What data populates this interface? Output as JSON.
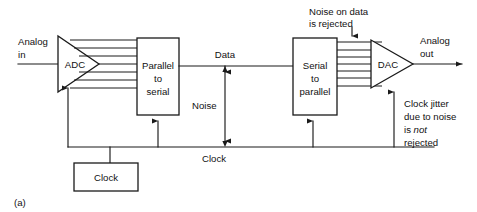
{
  "figure": {
    "caption": "(a)",
    "ink_color": "#1a1a1a",
    "background": "#ffffff"
  },
  "blocks": {
    "adc": {
      "label": "ADC",
      "shape": "triangle"
    },
    "parallel_to_serial": {
      "line1": "Parallel",
      "line2": "to",
      "line3": "serial",
      "shape": "rectangle"
    },
    "serial_to_parallel": {
      "line1": "Serial",
      "line2": "to",
      "line3": "parallel",
      "shape": "rectangle"
    },
    "dac": {
      "label": "DAC",
      "shape": "triangle"
    },
    "clock": {
      "label": "Clock",
      "shape": "rectangle"
    }
  },
  "ports": {
    "analog_in_line1": "Analog",
    "analog_in_line2": "in",
    "analog_out_line1": "Analog",
    "analog_out_line2": "out"
  },
  "signals": {
    "data": "Data",
    "noise": "Noise",
    "clock": "Clock"
  },
  "annotations": {
    "noise_rejected": {
      "line1": "Noise on data",
      "line2": "is rejected"
    },
    "clock_jitter": {
      "line1": "Clock jitter",
      "line2": "due to noise",
      "line3_pre": "is ",
      "line3_em": "not",
      "line4": "rejected"
    }
  }
}
